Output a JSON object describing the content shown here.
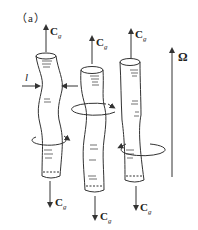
{
  "figure": {
    "panel_label": "（a）",
    "columns": [
      {
        "id": "left",
        "top_label": "C",
        "top_sub": "g",
        "bottom_label": "C",
        "bottom_sub": "g"
      },
      {
        "id": "middle",
        "top_label": "C",
        "top_sub": "g",
        "bottom_label": "C",
        "bottom_sub": "g"
      },
      {
        "id": "right",
        "top_label": "C",
        "top_sub": "g",
        "bottom_label": "C",
        "bottom_sub": "g"
      }
    ],
    "width_label": "l",
    "rotation_label": "Ω",
    "colors": {
      "stroke": "#333333",
      "background": "#ffffff"
    }
  }
}
